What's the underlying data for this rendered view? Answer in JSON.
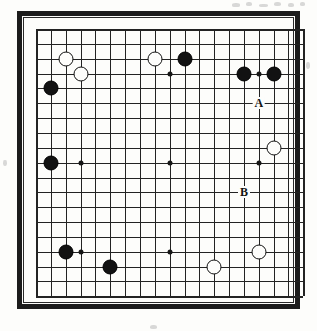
{
  "diagram": {
    "kind": "go-board-diagram",
    "board_size": 19,
    "frame_color": "#1c1c1c",
    "line_color": "#232323",
    "paper_color": "#fdfdfb",
    "black_color": "#121212",
    "white_color": "#fdfdfb"
  },
  "geometry": {
    "origin_x": 14,
    "origin_y": 13,
    "spacing": 14.85,
    "lines": 19
  },
  "hoshi": [
    {
      "col": 3,
      "row": 3
    },
    {
      "col": 9,
      "row": 3
    },
    {
      "col": 15,
      "row": 3
    },
    {
      "col": 3,
      "row": 9
    },
    {
      "col": 9,
      "row": 9
    },
    {
      "col": 15,
      "row": 9
    },
    {
      "col": 3,
      "row": 15
    },
    {
      "col": 9,
      "row": 15
    },
    {
      "col": 15,
      "row": 15
    }
  ],
  "stones": [
    {
      "color": "white",
      "col": 2,
      "row": 2,
      "name": "stone-white-c2-r2"
    },
    {
      "color": "white",
      "col": 3,
      "row": 3,
      "name": "stone-white-c3-r3"
    },
    {
      "color": "black",
      "col": 1,
      "row": 4,
      "name": "stone-black-c1-r4"
    },
    {
      "color": "white",
      "col": 8,
      "row": 2,
      "name": "stone-white-c8-r2"
    },
    {
      "color": "black",
      "col": 10,
      "row": 2,
      "name": "stone-black-c10-r2"
    },
    {
      "color": "black",
      "col": 14,
      "row": 3,
      "name": "stone-black-c14-r3"
    },
    {
      "color": "black",
      "col": 16,
      "row": 3,
      "name": "stone-black-c16-r3"
    },
    {
      "color": "black",
      "col": 1,
      "row": 9,
      "name": "stone-black-c1-r9"
    },
    {
      "color": "white",
      "col": 16,
      "row": 8,
      "name": "stone-white-c16-r8"
    },
    {
      "color": "black",
      "col": 2,
      "row": 15,
      "name": "stone-black-c2-r15"
    },
    {
      "color": "black",
      "col": 5,
      "row": 16,
      "name": "stone-black-c5-r16"
    },
    {
      "color": "white",
      "col": 12,
      "row": 16,
      "name": "stone-white-c12-r16"
    },
    {
      "color": "white",
      "col": 15,
      "row": 15,
      "name": "stone-white-c15-r15"
    }
  ],
  "markers": [
    {
      "label": "A",
      "col": 15,
      "row": 5,
      "name": "point-marker-a"
    },
    {
      "label": "B",
      "col": 14,
      "row": 11,
      "name": "point-marker-b"
    }
  ],
  "speckles": [
    {
      "x": 232,
      "y": 3,
      "w": 8,
      "h": 4
    },
    {
      "x": 246,
      "y": 2,
      "w": 6,
      "h": 4
    },
    {
      "x": 259,
      "y": 4,
      "w": 9,
      "h": 3
    },
    {
      "x": 274,
      "y": 2,
      "w": 7,
      "h": 4
    },
    {
      "x": 288,
      "y": 3,
      "w": 6,
      "h": 4
    },
    {
      "x": 300,
      "y": 2,
      "w": 5,
      "h": 4
    },
    {
      "x": 3,
      "y": 160,
      "w": 4,
      "h": 6
    },
    {
      "x": 306,
      "y": 62,
      "w": 4,
      "h": 7
    },
    {
      "x": 150,
      "y": 325,
      "w": 7,
      "h": 4
    }
  ]
}
